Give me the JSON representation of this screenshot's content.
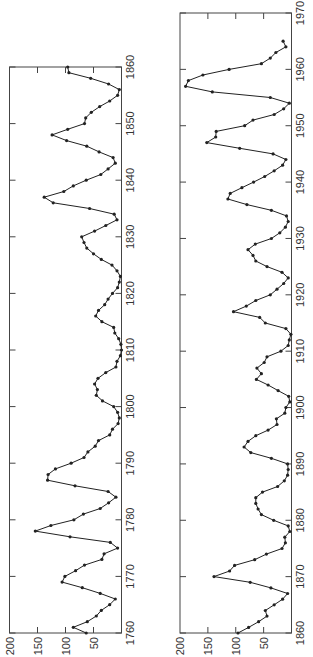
{
  "figure": {
    "orientation": "rotated-90-ccw",
    "line_color": "#222222",
    "frame_color": "#444444"
  },
  "chart_data": [
    {
      "type": "line",
      "title": "",
      "xlabel": "",
      "ylabel": "",
      "xlim": [
        1760,
        1860
      ],
      "ylim": [
        0,
        200
      ],
      "grid": false,
      "legend": null,
      "x_ticks": [
        1760,
        1770,
        1780,
        1790,
        1800,
        1810,
        1820,
        1830,
        1840,
        1850,
        1860
      ],
      "x_tick_labels": [
        "1760",
        "1770",
        "1780",
        "1790",
        "1800",
        "1810",
        "1820",
        "1830",
        "1840",
        "1850",
        "1860"
      ],
      "y_ticks": [
        50,
        100,
        150,
        200
      ],
      "y_tick_labels": [
        "50",
        "100",
        "150",
        "200"
      ],
      "series": [
        {
          "name": "annual values",
          "marker": "dot",
          "x": [
            1760,
            1761,
            1762,
            1763,
            1764,
            1765,
            1766,
            1767,
            1768,
            1769,
            1770,
            1771,
            1772,
            1773,
            1774,
            1775,
            1776,
            1777,
            1778,
            1779,
            1780,
            1781,
            1782,
            1783,
            1784,
            1785,
            1786,
            1787,
            1788,
            1789,
            1790,
            1791,
            1792,
            1793,
            1794,
            1795,
            1796,
            1797,
            1798,
            1799,
            1800,
            1801,
            1802,
            1803,
            1804,
            1805,
            1806,
            1807,
            1808,
            1809,
            1810,
            1811,
            1812,
            1813,
            1814,
            1815,
            1816,
            1817,
            1818,
            1819,
            1820,
            1821,
            1822,
            1823,
            1824,
            1825,
            1826,
            1827,
            1828,
            1829,
            1830,
            1831,
            1832,
            1833,
            1834,
            1835,
            1836,
            1837,
            1838,
            1839,
            1840,
            1841,
            1842,
            1843,
            1844,
            1845,
            1846,
            1847,
            1848,
            1849,
            1850,
            1851,
            1852,
            1853,
            1854,
            1855,
            1856,
            1857,
            1858,
            1859,
            1860
          ],
          "values": [
            63,
            86,
            61,
            45,
            36,
            21,
            11,
            38,
            70,
            106,
            101,
            82,
            66,
            35,
            31,
            7,
            20,
            92,
            154,
            126,
            85,
            68,
            38,
            23,
            10,
            24,
            83,
            132,
            131,
            118,
            90,
            67,
            60,
            47,
            41,
            21,
            16,
            6,
            4,
            7,
            14,
            34,
            45,
            43,
            48,
            42,
            28,
            10,
            8,
            2,
            0,
            1,
            5,
            12,
            14,
            35,
            46,
            41,
            30,
            24,
            16,
            7,
            4,
            2,
            8,
            17,
            36,
            50,
            62,
            67,
            71,
            48,
            28,
            8,
            13,
            57,
            122,
            138,
            103,
            86,
            63,
            37,
            24,
            11,
            15,
            40,
            62,
            98,
            124,
            96,
            66,
            64,
            54,
            39,
            21,
            7,
            4,
            23,
            55,
            94,
            96
          ]
        }
      ]
    },
    {
      "type": "line",
      "title": "",
      "xlabel": "",
      "ylabel": "",
      "xlim": [
        1860,
        1970
      ],
      "ylim": [
        0,
        200
      ],
      "grid": false,
      "legend": null,
      "x_ticks": [
        1860,
        1870,
        1880,
        1890,
        1900,
        1910,
        1920,
        1930,
        1940,
        1950,
        1960,
        1970
      ],
      "x_tick_labels": [
        "1860",
        "1870",
        "1880",
        "1890",
        "1900",
        "1910",
        "1920",
        "1930",
        "1940",
        "1950",
        "1960",
        "1970"
      ],
      "y_ticks": [
        50,
        100,
        150,
        200
      ],
      "y_tick_labels": [
        "50",
        "100",
        "150",
        "200"
      ],
      "series": [
        {
          "name": "annual values",
          "marker": "dot",
          "x": [
            1860,
            1861,
            1862,
            1863,
            1864,
            1865,
            1866,
            1867,
            1868,
            1869,
            1870,
            1871,
            1872,
            1873,
            1874,
            1875,
            1876,
            1877,
            1878,
            1879,
            1880,
            1881,
            1882,
            1883,
            1884,
            1885,
            1886,
            1887,
            1888,
            1889,
            1890,
            1891,
            1892,
            1893,
            1894,
            1895,
            1896,
            1897,
            1898,
            1899,
            1900,
            1901,
            1902,
            1903,
            1904,
            1905,
            1906,
            1907,
            1908,
            1909,
            1910,
            1911,
            1912,
            1913,
            1914,
            1915,
            1916,
            1917,
            1918,
            1919,
            1920,
            1921,
            1922,
            1923,
            1924,
            1925,
            1926,
            1927,
            1928,
            1929,
            1930,
            1931,
            1932,
            1933,
            1934,
            1935,
            1936,
            1937,
            1938,
            1939,
            1940,
            1941,
            1942,
            1943,
            1944,
            1945,
            1946,
            1947,
            1948,
            1949,
            1950,
            1951,
            1952,
            1953,
            1954,
            1955,
            1956,
            1957,
            1958,
            1959,
            1960,
            1961,
            1962,
            1963,
            1964,
            1965
          ],
          "values": [
            96,
            77,
            59,
            44,
            47,
            31,
            16,
            7,
            37,
            74,
            139,
            111,
            102,
            66,
            45,
            17,
            11,
            12,
            3,
            6,
            32,
            54,
            60,
            64,
            64,
            52,
            25,
            13,
            7,
            6,
            7,
            36,
            73,
            85,
            78,
            64,
            42,
            26,
            27,
            12,
            10,
            3,
            5,
            24,
            42,
            63,
            54,
            62,
            49,
            44,
            19,
            6,
            4,
            1,
            10,
            47,
            57,
            104,
            81,
            64,
            38,
            26,
            14,
            6,
            17,
            44,
            64,
            69,
            78,
            65,
            36,
            21,
            11,
            6,
            9,
            36,
            80,
            114,
            110,
            89,
            68,
            48,
            31,
            16,
            10,
            33,
            93,
            152,
            136,
            135,
            84,
            69,
            31,
            14,
            4,
            38,
            142,
            190,
            185,
            159,
            112,
            54,
            38,
            28,
            10,
            15
          ]
        }
      ]
    }
  ]
}
